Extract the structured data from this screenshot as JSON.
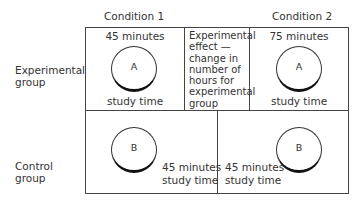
{
  "columns": {
    "condition1": "Condition 1",
    "condition2": "Condition 2"
  },
  "rows": {
    "experimental": [
      "Experimental",
      "group"
    ],
    "control": [
      "Control",
      "group"
    ]
  },
  "cells": {
    "exp_cond1": {
      "time": "45 minutes",
      "label": "A",
      "caption": "study time"
    },
    "exp_cond2": {
      "time": "75 minutes",
      "label": "A",
      "caption": "study time"
    },
    "effect_note": [
      "Experimental",
      "effect —",
      "change in",
      "number of",
      "hours for",
      "experimental",
      "group"
    ],
    "ctrl_cond1": {
      "label": "B",
      "time": "45 minutes",
      "caption": "study time"
    },
    "ctrl_cond2": {
      "label": "B",
      "time": "45 minutes",
      "caption": "study time"
    }
  }
}
